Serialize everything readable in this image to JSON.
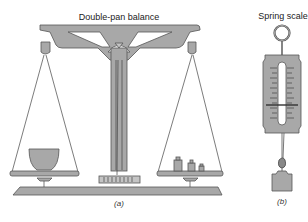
{
  "figure": {
    "panel_a": {
      "title": "Double-pan balance",
      "caption": "(a)",
      "left_pan_object": "bowl",
      "right_pan_object": "weights",
      "right_pan_weight_count": 3
    },
    "panel_b": {
      "title": "Spring scale",
      "caption": "(b)",
      "hanging_object": "block"
    },
    "colors": {
      "part_fill": "#a8a8a8",
      "outline": "#555555",
      "background": "#ffffff"
    }
  }
}
